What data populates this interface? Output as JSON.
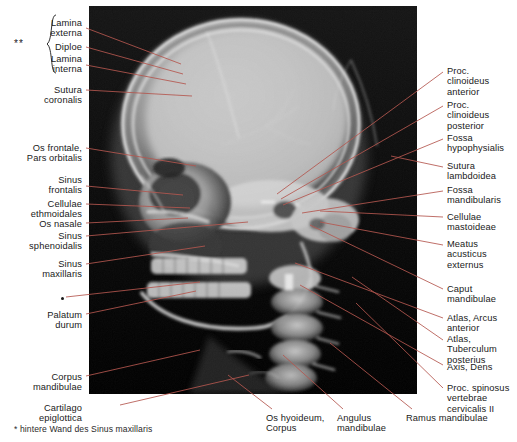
{
  "figure": {
    "type": "annotated-radiograph",
    "modality": "X-ray",
    "view": "lateral skull radiograph",
    "language": "de-la",
    "accent_color": "#b4574f",
    "text_color": "#1a1a1a",
    "background_color": "#ffffff",
    "image_background": "#000000",
    "footnote": "* hintere Wand des Sinus maxillaris",
    "group_marker": "**"
  },
  "labels_left": [
    {
      "id": "lamina-externa",
      "text": "Lamina\nexterna",
      "x": 82,
      "y": 18,
      "lx": 86,
      "ly": 28,
      "tx": 181,
      "ty": 64
    },
    {
      "id": "diploe",
      "text": "Diploe",
      "x": 82,
      "y": 42,
      "lx": 86,
      "ly": 47,
      "tx": 183,
      "ty": 74
    },
    {
      "id": "lamina-interna",
      "text": "Lamina\ninterna",
      "x": 82,
      "y": 54,
      "lx": 86,
      "ly": 65,
      "tx": 186,
      "ty": 84
    },
    {
      "id": "sutura-coronalis",
      "text": "Sutura\ncoronalis",
      "x": 82,
      "y": 85,
      "lx": 86,
      "ly": 90,
      "tx": 192,
      "ty": 96
    },
    {
      "id": "os-frontale",
      "text": "Os frontale,\nPars orbitalis",
      "x": 82,
      "y": 143,
      "lx": 86,
      "ly": 148,
      "tx": 196,
      "ty": 166
    },
    {
      "id": "sinus-frontalis",
      "text": "Sinus\nfrontalis",
      "x": 82,
      "y": 175,
      "lx": 86,
      "ly": 186,
      "tx": 183,
      "ty": 195
    },
    {
      "id": "cellulae-ethmoidales",
      "text": "Cellulae\nethmoidales",
      "x": 82,
      "y": 199,
      "lx": 86,
      "ly": 204,
      "tx": 190,
      "ty": 208
    },
    {
      "id": "os-nasale",
      "text": "Os nasale",
      "x": 82,
      "y": 219,
      "lx": 86,
      "ly": 223,
      "tx": 188,
      "ty": 218
    },
    {
      "id": "sinus-sphenoidalis",
      "text": "Sinus\nsphenoidalis",
      "x": 82,
      "y": 231,
      "lx": 86,
      "ly": 236,
      "tx": 248,
      "ty": 222
    },
    {
      "id": "sinus-maxillaris",
      "text": "Sinus\nmaxillaris",
      "x": 82,
      "y": 259,
      "lx": 86,
      "ly": 264,
      "tx": 205,
      "ty": 246
    },
    {
      "id": "sinus-maxillaris-wall",
      "text": "",
      "x": 82,
      "y": 295,
      "lx": 66,
      "ly": 297,
      "tx": 200,
      "ty": 282
    },
    {
      "id": "palatum-durum",
      "text": "Palatum\ndurum",
      "x": 82,
      "y": 310,
      "lx": 86,
      "ly": 314,
      "tx": 196,
      "ty": 291
    },
    {
      "id": "corpus-mandibulae",
      "text": "Corpus\nmandibulae",
      "x": 82,
      "y": 372,
      "lx": 86,
      "ly": 376,
      "tx": 200,
      "ty": 350
    },
    {
      "id": "cartilago-epiglottica",
      "text": "Cartilago epiglottica",
      "x": 82,
      "y": 403,
      "lx": 120,
      "ly": 405,
      "tx": 249,
      "ty": 375
    }
  ],
  "labels_right": [
    {
      "id": "proc-clinoideus-anterior",
      "text": "Proc.\nclinoideus\nanterior",
      "x": 447,
      "y": 66,
      "lx": 443,
      "ly": 72,
      "tx": 277,
      "ty": 194
    },
    {
      "id": "proc-clinoideus-posterior",
      "text": "Proc.\nclinoideus\nposterior",
      "x": 447,
      "y": 100,
      "lx": 443,
      "ly": 106,
      "tx": 281,
      "ty": 199
    },
    {
      "id": "fossa-hypophysialis",
      "text": "Fossa\nhypophysialis",
      "x": 447,
      "y": 133,
      "lx": 443,
      "ly": 139,
      "tx": 283,
      "ty": 205
    },
    {
      "id": "sutura-lambdoidea",
      "text": "Sutura\nlambdoidea",
      "x": 447,
      "y": 161,
      "lx": 443,
      "ly": 167,
      "tx": 391,
      "ty": 156
    },
    {
      "id": "fossa-mandibularis",
      "text": "Fossa\nmandibularis",
      "x": 447,
      "y": 185,
      "lx": 443,
      "ly": 191,
      "tx": 302,
      "ty": 213
    },
    {
      "id": "cellulae-mastoideae",
      "text": "Cellulae\nmastoideae",
      "x": 447,
      "y": 212,
      "lx": 443,
      "ly": 217,
      "tx": 320,
      "ty": 211
    },
    {
      "id": "meatus-acusticus-externus",
      "text": "Meatus\nacusticus\nexternus",
      "x": 447,
      "y": 239,
      "lx": 443,
      "ly": 245,
      "tx": 320,
      "ty": 222
    },
    {
      "id": "caput-mandibulae",
      "text": "Caput\nmandibulae",
      "x": 447,
      "y": 284,
      "lx": 443,
      "ly": 289,
      "tx": 310,
      "ty": 225
    },
    {
      "id": "atlas-arcus-anterior",
      "text": "Atlas, Arcus\nanterior",
      "x": 447,
      "y": 313,
      "lx": 443,
      "ly": 318,
      "tx": 295,
      "ty": 263
    },
    {
      "id": "atlas-tuberculum-posterius",
      "text": "Atlas,\nTuberculum\nposterius",
      "x": 447,
      "y": 334,
      "lx": 443,
      "ly": 340,
      "tx": 352,
      "ty": 277
    },
    {
      "id": "axis-dens",
      "text": "Axis, Dens",
      "x": 447,
      "y": 362,
      "lx": 443,
      "ly": 365,
      "tx": 300,
      "ty": 285
    },
    {
      "id": "proc-spinosus-vert-cerv-ii",
      "text": "Proc. spinosus\nvertebrae\ncervicalis II",
      "x": 447,
      "y": 383,
      "lx": 443,
      "ly": 388,
      "tx": 356,
      "ty": 303
    }
  ],
  "labels_bottom": [
    {
      "id": "os-hyoideum-corpus",
      "text": "Os hyoideum,\nCorpus",
      "x": 266,
      "y": 413,
      "lx": 272,
      "ly": 409,
      "tx": 228,
      "ty": 375
    },
    {
      "id": "angulus-mandibulae",
      "text": "Angulus\nmandibulae",
      "x": 337,
      "y": 413,
      "lx": 343,
      "ly": 409,
      "tx": 283,
      "ty": 355
    },
    {
      "id": "ramus-mandibulae",
      "text": "Ramus mandibulae",
      "x": 406,
      "y": 413,
      "lx": 412,
      "ly": 409,
      "tx": 330,
      "ty": 343
    }
  ],
  "anatomy_overlay": {
    "note": "calvaria, facial skeleton, mandible, cervical spine rendered as grayscale radiograph"
  }
}
